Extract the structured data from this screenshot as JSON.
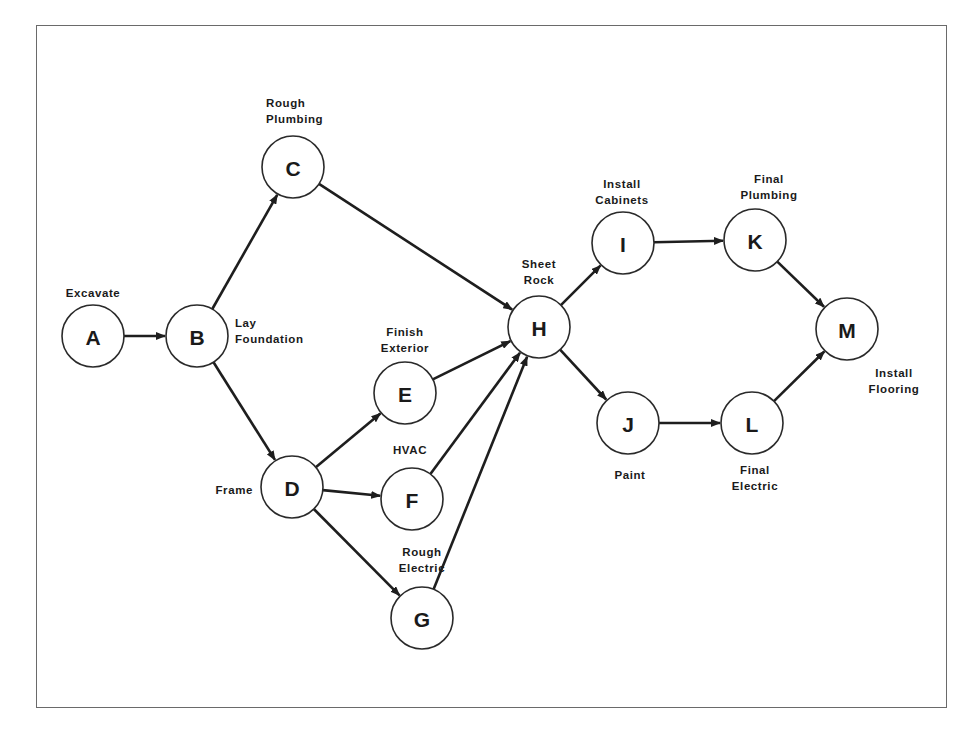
{
  "diagram": {
    "type": "activity-on-node network",
    "frame": {
      "left": 36,
      "top": 25,
      "right": 947,
      "bottom": 708
    },
    "colors": {
      "stroke": "#1e1e1e",
      "node_fill": "#ffffff",
      "text": "#1a1a1a",
      "frame": "#6a6a6a"
    },
    "node_radius": 31,
    "nodes": [
      {
        "id": "A",
        "cx": 93,
        "cy": 336,
        "label_lines": [
          "Excavate"
        ],
        "label_x": 93,
        "label_y": 297,
        "anchor": "middle"
      },
      {
        "id": "B",
        "cx": 197,
        "cy": 336,
        "label_lines": [
          "Lay",
          "Foundation"
        ],
        "label_x": 235,
        "label_y": 327,
        "anchor": "start"
      },
      {
        "id": "C",
        "cx": 293,
        "cy": 167,
        "label_lines": [
          "Rough",
          "Plumbing"
        ],
        "label_x": 266,
        "label_y": 107,
        "anchor": "start"
      },
      {
        "id": "D",
        "cx": 292,
        "cy": 487,
        "label_lines": [
          "Frame"
        ],
        "label_x": 253,
        "label_y": 494,
        "anchor": "end"
      },
      {
        "id": "E",
        "cx": 405,
        "cy": 393,
        "label_lines": [
          "Finish",
          "Exterior"
        ],
        "label_x": 405,
        "label_y": 336,
        "anchor": "middle"
      },
      {
        "id": "F",
        "cx": 412,
        "cy": 499,
        "label_lines": [
          "HVAC"
        ],
        "label_x": 410,
        "label_y": 454,
        "anchor": "middle"
      },
      {
        "id": "G",
        "cx": 422,
        "cy": 618,
        "label_lines": [
          "Rough",
          "Electric"
        ],
        "label_x": 422,
        "label_y": 556,
        "anchor": "middle"
      },
      {
        "id": "H",
        "cx": 539,
        "cy": 327,
        "label_lines": [
          "Sheet",
          "Rock"
        ],
        "label_x": 539,
        "label_y": 268,
        "anchor": "middle"
      },
      {
        "id": "I",
        "cx": 623,
        "cy": 243,
        "label_lines": [
          "Install",
          "Cabinets"
        ],
        "label_x": 622,
        "label_y": 188,
        "anchor": "middle"
      },
      {
        "id": "J",
        "cx": 628,
        "cy": 423,
        "label_lines": [
          "Paint"
        ],
        "label_x": 630,
        "label_y": 479,
        "anchor": "middle"
      },
      {
        "id": "K",
        "cx": 755,
        "cy": 240,
        "label_lines": [
          "Final",
          "Plumbing"
        ],
        "label_x": 769,
        "label_y": 183,
        "anchor": "middle"
      },
      {
        "id": "L",
        "cx": 752,
        "cy": 423,
        "label_lines": [
          "Final",
          "Electric"
        ],
        "label_x": 755,
        "label_y": 474,
        "anchor": "middle"
      },
      {
        "id": "M",
        "cx": 847,
        "cy": 329,
        "label_lines": [
          "Install",
          "Flooring"
        ],
        "label_x": 894,
        "label_y": 377,
        "anchor": "middle"
      }
    ],
    "edges": [
      {
        "from": "A",
        "to": "B"
      },
      {
        "from": "B",
        "to": "C"
      },
      {
        "from": "B",
        "to": "D"
      },
      {
        "from": "C",
        "to": "H"
      },
      {
        "from": "D",
        "to": "E"
      },
      {
        "from": "D",
        "to": "F"
      },
      {
        "from": "D",
        "to": "G"
      },
      {
        "from": "E",
        "to": "H"
      },
      {
        "from": "F",
        "to": "H"
      },
      {
        "from": "G",
        "to": "H"
      },
      {
        "from": "H",
        "to": "I"
      },
      {
        "from": "H",
        "to": "J"
      },
      {
        "from": "I",
        "to": "K"
      },
      {
        "from": "J",
        "to": "L"
      },
      {
        "from": "K",
        "to": "M"
      },
      {
        "from": "L",
        "to": "M"
      }
    ]
  }
}
